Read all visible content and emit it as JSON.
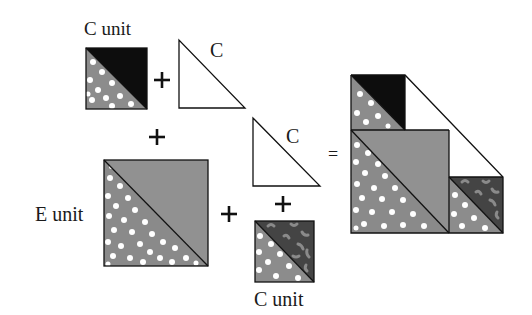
{
  "diagram": {
    "colors": {
      "background": "#ffffff",
      "dotted_gray": "#8c8c8c",
      "plain_gray": "#909090",
      "black": "#0d0d0d",
      "dark_print": "#444444",
      "print_marks": "#8a8a8a",
      "white_triangle": "#ffffff",
      "outline": "#111111"
    },
    "labels": {
      "c_unit_top": "C unit",
      "c_triangle_1": "C",
      "c_triangle_2": "C",
      "e_unit": "E unit",
      "c_unit_bottom": "C unit"
    },
    "operators": {
      "plus": "+",
      "equals": "="
    },
    "pieces": [
      {
        "id": "c-unit-black",
        "type": "half-square triangle",
        "label": "C unit",
        "fabrics": [
          "dotted gray",
          "black"
        ]
      },
      {
        "id": "c-triangle-1",
        "type": "triangle",
        "label": "C",
        "fabrics": [
          "white"
        ]
      },
      {
        "id": "e-unit",
        "type": "half-square triangle",
        "label": "E unit",
        "fabrics": [
          "dotted gray",
          "plain gray"
        ]
      },
      {
        "id": "c-triangle-2",
        "type": "triangle",
        "label": "C",
        "fabrics": [
          "white"
        ]
      },
      {
        "id": "c-unit-print",
        "type": "half-square triangle",
        "label": "C unit",
        "fabrics": [
          "dotted gray",
          "dark print"
        ]
      }
    ],
    "result": {
      "description": "Assembled block combining all pieces"
    }
  }
}
